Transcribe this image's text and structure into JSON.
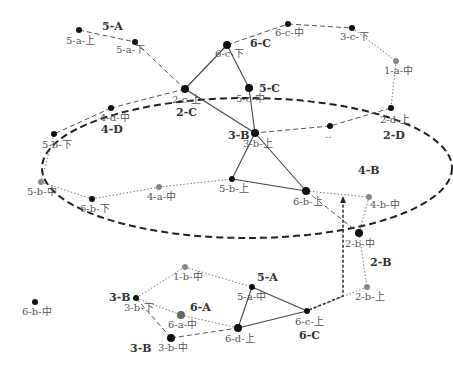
{
  "diagram": {
    "ellipse": {
      "cx": 247,
      "cy": 168,
      "rx": 205,
      "ry": 70,
      "color": "#222222"
    },
    "nodes": [
      {
        "id": "5-a-上",
        "x": 79,
        "y": 30,
        "r": 3,
        "color": "#111111",
        "label": "5-a-上",
        "lx": 66,
        "ly": 44
      },
      {
        "id": "5-a-下",
        "x": 135,
        "y": 42,
        "r": 3,
        "color": "#111111",
        "label": "5-a-下",
        "lx": 116,
        "ly": 53
      },
      {
        "id": "6-c-中",
        "x": 288,
        "y": 24,
        "r": 3,
        "color": "#111111",
        "label": "6-c-中",
        "lx": 275,
        "ly": 36
      },
      {
        "id": "3-c-下",
        "x": 352,
        "y": 28,
        "r": 3,
        "color": "#111111",
        "label": "3-c-下",
        "lx": 340,
        "ly": 40
      },
      {
        "id": "6-c-下",
        "x": 227,
        "y": 45,
        "r": 4,
        "color": "#111111",
        "label": "6-c-下",
        "lx": 215,
        "ly": 57
      },
      {
        "id": "1-a-中",
        "x": 396,
        "y": 61,
        "r": 3,
        "color": "#888888",
        "label": "1-a-中",
        "lx": 384,
        "ly": 74
      },
      {
        "id": "2-c-上",
        "x": 185,
        "y": 89,
        "r": 4,
        "color": "#111111",
        "label": "2-c-上",
        "lx": 172,
        "ly": 103
      },
      {
        "id": "5-c-中",
        "x": 249,
        "y": 88,
        "r": 4,
        "color": "#111111",
        "label": "5-c-中",
        "lx": 236,
        "ly": 102
      },
      {
        "id": "2-d-上",
        "x": 391,
        "y": 108,
        "r": 3,
        "color": "#111111",
        "label": "2-d-上",
        "lx": 380,
        "ly": 123
      },
      {
        "id": "4-d-中",
        "x": 111,
        "y": 108,
        "r": 3,
        "color": "#111111",
        "label": "4-d-中",
        "lx": 100,
        "ly": 121
      },
      {
        "id": "unlabeled",
        "x": 330,
        "y": 126,
        "r": 3,
        "color": "#111111",
        "label": "‥",
        "lx": 325,
        "ly": 138
      },
      {
        "id": "3-b-上",
        "x": 255,
        "y": 133,
        "r": 4,
        "color": "#111111",
        "label": "3-b-上",
        "lx": 243,
        "ly": 147
      },
      {
        "id": "5-b-下",
        "x": 54,
        "y": 134,
        "r": 3,
        "color": "#111111",
        "label": "5-b-下",
        "lx": 42,
        "ly": 148
      },
      {
        "id": "5-b-上",
        "x": 232,
        "y": 179,
        "r": 3,
        "color": "#111111",
        "label": "5-b-上",
        "lx": 219,
        "ly": 192
      },
      {
        "id": "5-b-中",
        "x": 41,
        "y": 182,
        "r": 3,
        "color": "#888888",
        "label": "5-b-中",
        "lx": 27,
        "ly": 195
      },
      {
        "id": "4-a-中",
        "x": 159,
        "y": 187,
        "r": 3,
        "color": "#888888",
        "label": "4-a-中",
        "lx": 147,
        "ly": 200
      },
      {
        "id": "6-b-上",
        "x": 306,
        "y": 191,
        "r": 4,
        "color": "#111111",
        "label": "6-b-上",
        "lx": 293,
        "ly": 205
      },
      {
        "id": "4-b-中",
        "x": 369,
        "y": 197,
        "r": 3,
        "color": "#888888",
        "label": "4-b-中",
        "lx": 370,
        "ly": 208
      },
      {
        "id": "6-b-下",
        "x": 92,
        "y": 199,
        "r": 3,
        "color": "#111111",
        "label": "6-b-下",
        "lx": 80,
        "ly": 212
      },
      {
        "id": "2-b-中",
        "x": 359,
        "y": 233,
        "r": 4,
        "color": "#111111",
        "label": "2-b-中",
        "lx": 345,
        "ly": 247
      },
      {
        "id": "1-b-中",
        "x": 185,
        "y": 267,
        "r": 3,
        "color": "#888888",
        "label": "1-b-中",
        "lx": 173,
        "ly": 280
      },
      {
        "id": "2-b-上",
        "x": 367,
        "y": 287,
        "r": 3,
        "color": "#888888",
        "label": "2-b-上",
        "lx": 355,
        "ly": 300
      },
      {
        "id": "5-a-中",
        "x": 252,
        "y": 287,
        "r": 3,
        "color": "#111111",
        "label": "5-a-中",
        "lx": 237,
        "ly": 300
      },
      {
        "id": "6-b-中",
        "x": 35,
        "y": 302,
        "r": 3,
        "color": "#111111",
        "label": "6-b-中",
        "lx": 22,
        "ly": 315
      },
      {
        "id": "3-b-下",
        "x": 136,
        "y": 298,
        "r": 3,
        "color": "#111111",
        "label": "3-b-下",
        "lx": 124,
        "ly": 311
      },
      {
        "id": "6-a-中",
        "x": 181,
        "y": 315,
        "r": 4,
        "color": "#666666",
        "label": "6-a-中",
        "lx": 168,
        "ly": 328
      },
      {
        "id": "6-c-上",
        "x": 307,
        "y": 311,
        "r": 3,
        "color": "#111111",
        "label": "6-c-上",
        "lx": 295,
        "ly": 325
      },
      {
        "id": "6-d-上",
        "x": 238,
        "y": 328,
        "r": 4,
        "color": "#111111",
        "label": "6-d-上",
        "lx": 225,
        "ly": 342
      },
      {
        "id": "3-b-中",
        "x": 171,
        "y": 338,
        "r": 4,
        "color": "#111111",
        "label": "3-b-中",
        "lx": 158,
        "ly": 351
      }
    ],
    "edges": [
      {
        "x1": 79,
        "y1": 30,
        "x2": 135,
        "y2": 42,
        "style": "dashed"
      },
      {
        "x1": 135,
        "y1": 42,
        "x2": 185,
        "y2": 89,
        "style": "dashed"
      },
      {
        "x1": 185,
        "y1": 89,
        "x2": 227,
        "y2": 45,
        "style": "solid"
      },
      {
        "x1": 227,
        "y1": 45,
        "x2": 288,
        "y2": 24,
        "style": "dashed"
      },
      {
        "x1": 288,
        "y1": 24,
        "x2": 352,
        "y2": 28,
        "style": "dashed"
      },
      {
        "x1": 352,
        "y1": 28,
        "x2": 396,
        "y2": 61,
        "style": "dotted"
      },
      {
        "x1": 396,
        "y1": 61,
        "x2": 391,
        "y2": 108,
        "style": "dotted"
      },
      {
        "x1": 391,
        "y1": 108,
        "x2": 330,
        "y2": 126,
        "style": "dashed"
      },
      {
        "x1": 330,
        "y1": 126,
        "x2": 255,
        "y2": 133,
        "style": "dashed"
      },
      {
        "x1": 227,
        "y1": 45,
        "x2": 249,
        "y2": 88,
        "style": "solid"
      },
      {
        "x1": 249,
        "y1": 88,
        "x2": 255,
        "y2": 133,
        "style": "solid"
      },
      {
        "x1": 185,
        "y1": 89,
        "x2": 255,
        "y2": 133,
        "style": "solid"
      },
      {
        "x1": 185,
        "y1": 89,
        "x2": 111,
        "y2": 108,
        "style": "dashed"
      },
      {
        "x1": 111,
        "y1": 108,
        "x2": 54,
        "y2": 134,
        "style": "dashed"
      },
      {
        "x1": 54,
        "y1": 134,
        "x2": 41,
        "y2": 182,
        "style": "dotted"
      },
      {
        "x1": 41,
        "y1": 182,
        "x2": 92,
        "y2": 199,
        "style": "dotted"
      },
      {
        "x1": 92,
        "y1": 199,
        "x2": 159,
        "y2": 187,
        "style": "dotted"
      },
      {
        "x1": 159,
        "y1": 187,
        "x2": 232,
        "y2": 179,
        "style": "dotted"
      },
      {
        "x1": 255,
        "y1": 133,
        "x2": 232,
        "y2": 179,
        "style": "solid"
      },
      {
        "x1": 255,
        "y1": 133,
        "x2": 306,
        "y2": 191,
        "style": "solid"
      },
      {
        "x1": 232,
        "y1": 179,
        "x2": 306,
        "y2": 191,
        "style": "solid"
      },
      {
        "x1": 306,
        "y1": 191,
        "x2": 369,
        "y2": 197,
        "style": "dotted"
      },
      {
        "x1": 369,
        "y1": 197,
        "x2": 359,
        "y2": 233,
        "style": "dotted"
      },
      {
        "x1": 306,
        "y1": 191,
        "x2": 359,
        "y2": 233,
        "style": "dashed"
      },
      {
        "x1": 359,
        "y1": 233,
        "x2": 367,
        "y2": 287,
        "style": "dotted"
      },
      {
        "x1": 367,
        "y1": 287,
        "x2": 307,
        "y2": 311,
        "style": "dotted"
      },
      {
        "x1": 136,
        "y1": 298,
        "x2": 185,
        "y2": 267,
        "style": "dotted"
      },
      {
        "x1": 185,
        "y1": 267,
        "x2": 252,
        "y2": 287,
        "style": "dotted"
      },
      {
        "x1": 252,
        "y1": 287,
        "x2": 307,
        "y2": 311,
        "style": "solid"
      },
      {
        "x1": 252,
        "y1": 287,
        "x2": 238,
        "y2": 328,
        "style": "solid"
      },
      {
        "x1": 238,
        "y1": 328,
        "x2": 307,
        "y2": 311,
        "style": "solid"
      },
      {
        "x1": 136,
        "y1": 298,
        "x2": 181,
        "y2": 315,
        "style": "dotted"
      },
      {
        "x1": 181,
        "y1": 315,
        "x2": 238,
        "y2": 328,
        "style": "dotted"
      },
      {
        "x1": 136,
        "y1": 298,
        "x2": 171,
        "y2": 338,
        "style": "dashed"
      },
      {
        "x1": 171,
        "y1": 338,
        "x2": 238,
        "y2": 328,
        "style": "dashed"
      }
    ],
    "arrow": {
      "points": "309,310 343,296 343,198",
      "tipx": 343,
      "tipy": 196
    },
    "group_labels": [
      {
        "text": "5-A",
        "x": 102,
        "y": 30
      },
      {
        "text": "6-C",
        "x": 250,
        "y": 47
      },
      {
        "text": "5-C",
        "x": 259,
        "y": 92
      },
      {
        "text": "2-C",
        "x": 176,
        "y": 116
      },
      {
        "text": "4-D",
        "x": 101,
        "y": 133
      },
      {
        "text": "3-B",
        "x": 228,
        "y": 139
      },
      {
        "text": "2-D",
        "x": 383,
        "y": 139
      },
      {
        "text": "4-B",
        "x": 358,
        "y": 174
      },
      {
        "text": "2-B",
        "x": 370,
        "y": 266
      },
      {
        "text": "5-A",
        "x": 257,
        "y": 281
      },
      {
        "text": "3-B",
        "x": 109,
        "y": 301
      },
      {
        "text": "6-A",
        "x": 190,
        "y": 311
      },
      {
        "text": "6-C",
        "x": 299,
        "y": 339
      },
      {
        "text": "3-B",
        "x": 130,
        "y": 352
      }
    ]
  }
}
